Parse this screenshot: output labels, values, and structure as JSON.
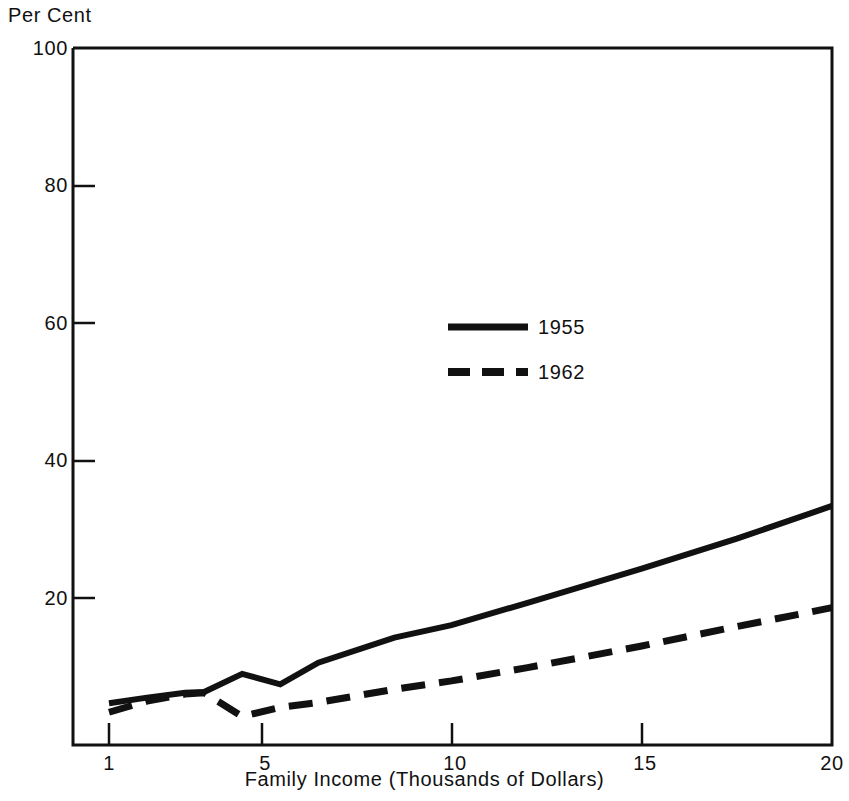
{
  "chart_data": {
    "type": "line",
    "title": "",
    "subtitle": "",
    "xlabel": "Family Income (Thousands of Dollars)",
    "ylabel": "Per Cent",
    "xlim": [
      1,
      20
    ],
    "ylim": [
      0,
      100
    ],
    "xticks": [
      1,
      5,
      10,
      15,
      20
    ],
    "xticklabels": [
      "1",
      "5",
      "10",
      "15",
      "20"
    ],
    "yticks": [
      20,
      40,
      60,
      80,
      100
    ],
    "yticklabels": [
      "20",
      "40",
      "60",
      "80",
      "100"
    ],
    "grid": false,
    "legend_position": "center",
    "series": [
      {
        "name": "1955",
        "style": "solid",
        "x": [
          1.0,
          2.0,
          3.0,
          3.5,
          4.5,
          5.5,
          6.5,
          8.5,
          10.0,
          12.0,
          15.0,
          17.5,
          20.0
        ],
        "values": [
          6.0,
          6.8,
          7.5,
          7.6,
          10.2,
          8.7,
          11.8,
          15.4,
          17.2,
          20.4,
          25.3,
          29.6,
          34.3
        ]
      },
      {
        "name": "1962",
        "style": "dashed",
        "x": [
          1.0,
          2.0,
          3.0,
          3.5,
          4.5,
          5.5,
          6.5,
          8.5,
          10.0,
          12.0,
          15.0,
          17.5,
          20.0
        ],
        "values": [
          4.7,
          6.3,
          7.3,
          7.5,
          4.1,
          5.4,
          6.1,
          8.0,
          9.2,
          11.1,
          14.2,
          17.0,
          19.7
        ]
      }
    ]
  },
  "legend": {
    "entries": [
      {
        "label": "1955",
        "style": "solid"
      },
      {
        "label": "1962",
        "style": "dashed"
      }
    ]
  },
  "axis": {
    "y_title": "Per Cent",
    "x_title": "Family Income (Thousands of Dollars)",
    "ytick_100": "100",
    "ytick_80": "80",
    "ytick_60": "60",
    "ytick_40": "40",
    "ytick_20": "20",
    "xtick_1": "1",
    "xtick_5": "5",
    "xtick_10": "10",
    "xtick_15": "15",
    "xtick_20": "20"
  },
  "colors": {
    "ink": "#111111",
    "background": "#ffffff"
  }
}
